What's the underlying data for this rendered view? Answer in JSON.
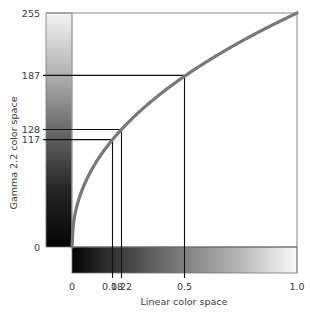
{
  "chart_data": {
    "type": "line",
    "title": "",
    "xlabel": "Linear color space",
    "ylabel": "Gamma 2.2 color space",
    "xlim": [
      0,
      1.0
    ],
    "ylim": [
      0,
      255
    ],
    "x_tick_labels": [
      "0",
      "0.18",
      "0.22",
      "0.5",
      "1.0"
    ],
    "x_ticks": [
      0,
      0.18,
      0.22,
      0.5,
      1.0
    ],
    "y_tick_labels": [
      "0",
      "117",
      "128",
      "187",
      "255"
    ],
    "y_ticks": [
      0,
      117,
      128,
      187,
      255
    ],
    "series": [
      {
        "name": "Gamma 2.2 encoding curve",
        "color": "#787878",
        "function": "y = 255 * x^(1/2.2)",
        "x": [
          0,
          0.01,
          0.05,
          0.1,
          0.18,
          0.22,
          0.3,
          0.4,
          0.5,
          0.6,
          0.7,
          0.8,
          0.9,
          1.0
        ],
        "y": [
          0,
          31,
          65,
          90,
          117,
          128,
          147,
          168,
          187,
          201,
          216,
          230,
          243,
          255
        ]
      }
    ],
    "reference_points": [
      {
        "x": 0.18,
        "y": 117
      },
      {
        "x": 0.22,
        "y": 128
      },
      {
        "x": 0.5,
        "y": 187
      }
    ],
    "annotations": [
      "Vertical grayscale gradient bar along y-axis (white at 255 to black at 0)",
      "Horizontal grayscale gradient bar along x-axis (black at 0 to white at 1.0)"
    ],
    "grid": false,
    "legend": "none"
  }
}
